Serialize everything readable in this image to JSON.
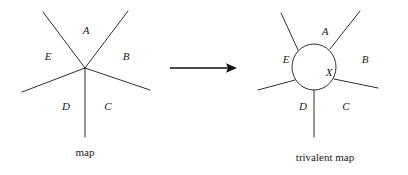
{
  "figure": {
    "type": "diagram",
    "background_color": "#ffffff",
    "ink_color": "#1a1a1a",
    "width": 408,
    "height": 175
  },
  "left_diagram": {
    "caption": "map",
    "vertex": {
      "x": 85,
      "y": 68,
      "valence": 5
    },
    "region_labels": [
      {
        "id": "A",
        "text": "A",
        "x": 86,
        "y": 31
      },
      {
        "id": "B",
        "text": "B",
        "x": 126,
        "y": 57
      },
      {
        "id": "C",
        "text": "C",
        "x": 108,
        "y": 107
      },
      {
        "id": "D",
        "text": "D",
        "x": 66,
        "y": 107
      },
      {
        "id": "E",
        "text": "E",
        "x": 48,
        "y": 57
      }
    ],
    "edges": [
      {
        "id": "edge-upper-left",
        "x1": 85,
        "y1": 68,
        "x2": 43,
        "y2": 12
      },
      {
        "id": "edge-upper-right",
        "x1": 85,
        "y1": 68,
        "x2": 128,
        "y2": 11
      },
      {
        "id": "edge-lower-right",
        "x1": 85,
        "y1": 68,
        "x2": 150,
        "y2": 90
      },
      {
        "id": "edge-bottom",
        "x1": 85,
        "y1": 68,
        "x2": 85,
        "y2": 137
      },
      {
        "id": "edge-lower-left",
        "x1": 85,
        "y1": 68,
        "x2": 22,
        "y2": 92
      }
    ],
    "caption_position": {
      "x": 85,
      "y": 153
    }
  },
  "arrow": {
    "x1": 170,
    "y1": 68,
    "x2": 237,
    "y2": 68,
    "color": "#111111"
  },
  "right_diagram": {
    "caption": "trivalent map",
    "vertex_circle": {
      "label": "X",
      "cx": 314,
      "cy": 67,
      "rx": 22,
      "ry": 23,
      "label_x": 329,
      "label_y": 73
    },
    "region_labels": [
      {
        "id": "A",
        "text": "A",
        "x": 325,
        "y": 32
      },
      {
        "id": "B",
        "text": "B",
        "x": 365,
        "y": 60
      },
      {
        "id": "C",
        "text": "C",
        "x": 346,
        "y": 107
      },
      {
        "id": "D",
        "text": "D",
        "x": 303,
        "y": 107
      },
      {
        "id": "E",
        "text": "E",
        "x": 286,
        "y": 60
      }
    ],
    "edges": [
      {
        "id": "edge-upper-left",
        "x1": 298,
        "y1": 50,
        "x2": 281,
        "y2": 13
      },
      {
        "id": "edge-upper-right",
        "x1": 330,
        "y1": 49,
        "x2": 360,
        "y2": 11
      },
      {
        "id": "edge-lower-right",
        "x1": 334,
        "y1": 79,
        "x2": 378,
        "y2": 88
      },
      {
        "id": "edge-bottom",
        "x1": 314,
        "y1": 90,
        "x2": 314,
        "y2": 137
      },
      {
        "id": "edge-lower-left",
        "x1": 295,
        "y1": 80,
        "x2": 258,
        "y2": 90
      }
    ],
    "caption_position": {
      "x": 325,
      "y": 158
    }
  }
}
